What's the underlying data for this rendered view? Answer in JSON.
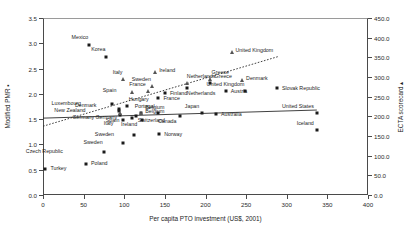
{
  "chart_data": {
    "type": "scatter",
    "title": "",
    "xlabel": "Per capita PTO investment (US$, 2001)",
    "ylabel_left": "Modified PMR ▪",
    "ylabel_right": "ECTA scorecard ▴",
    "xlim": [
      0,
      400
    ],
    "ylim_left": [
      0.0,
      3.5
    ],
    "ylim_right": [
      0.0,
      450.0
    ],
    "xticks": [
      0,
      50,
      100,
      150,
      200,
      250,
      300,
      350,
      400
    ],
    "yticks_left": [
      "0.0",
      "0.5",
      "1.0",
      "1.5",
      "2.0",
      "2.5",
      "3.0",
      "3.5"
    ],
    "yticks_right": [
      "0.0",
      "50.0",
      "100.0",
      "150.0",
      "200.0",
      "250.0",
      "300.0",
      "350.0",
      "400.0",
      "450.0"
    ],
    "grid": false,
    "legend": "none",
    "series": [
      {
        "name": "Modified PMR",
        "marker": "square",
        "axis": "left",
        "color": "#1a1a1a",
        "points": [
          {
            "label": "Mexico",
            "x": 57,
            "y": 2.97,
            "lx": -1,
            "ly": -7
          },
          {
            "label": "Korea",
            "x": 78,
            "y": 2.72,
            "lx": -1,
            "ly": -7
          },
          {
            "label": "Greece",
            "x": 205,
            "y": 2.21,
            "lx": 5,
            "ly": -6
          },
          {
            "label": "Netherlands",
            "x": 177,
            "y": 2.12,
            "lx": 0,
            "ly": 6
          },
          {
            "label": "Finland",
            "x": 150,
            "y": 2.02,
            "lx": 5,
            "ly": 1
          },
          {
            "label": "France",
            "x": 142,
            "y": 1.91,
            "lx": 5,
            "ly": 1
          },
          {
            "label": "Slovak Republic",
            "x": 288,
            "y": 2.12,
            "lx": 5,
            "ly": 1
          },
          {
            "label": "Austria",
            "x": 225,
            "y": 2.05,
            "lx": 5,
            "ly": 1
          },
          {
            "label": "United Kingdom",
            "x": 249,
            "y": 2.05,
            "lx": -1,
            "ly": -6
          },
          {
            "label": "Luxembourg",
            "x": 85,
            "y": 1.8,
            "lx": -31,
            "ly": 0
          },
          {
            "label": "Hungary",
            "x": 103,
            "y": 1.76,
            "lx": 2,
            "ly": -6
          },
          {
            "label": "Denmark",
            "x": 94,
            "y": 1.71,
            "lx": -23,
            "ly": -3
          },
          {
            "label": "New Zealand",
            "x": 93,
            "y": 1.66,
            "lx": -33,
            "ly": 0
          },
          {
            "label": "Belgium",
            "x": 121,
            "y": 1.63,
            "lx": 4,
            "ly": -5
          },
          {
            "label": "Germany",
            "x": 95,
            "y": 1.58,
            "lx": -26,
            "ly": 3
          },
          {
            "label": "Switzerland",
            "x": 114,
            "y": 1.56,
            "lx": 2,
            "ly": 5
          },
          {
            "label": "Australia",
            "x": 213,
            "y": 1.6,
            "lx": 5,
            "ly": 1
          },
          {
            "label": "Japan",
            "x": 196,
            "y": 1.63,
            "lx": -3,
            "ly": -6
          },
          {
            "label": "United States",
            "x": 337,
            "y": 1.62,
            "lx": -3,
            "ly": -6
          },
          {
            "label": "Portugal",
            "x": 141,
            "y": 1.62,
            "lx": -3,
            "ly": -6
          },
          {
            "label": "Canada",
            "x": 168,
            "y": 1.56,
            "lx": -3,
            "ly": 6
          },
          {
            "label": "Spain",
            "x": 110,
            "y": 1.52,
            "lx": -13,
            "ly": 3
          },
          {
            "label": "Ireland",
            "x": 122,
            "y": 1.49,
            "lx": -5,
            "ly": 5
          },
          {
            "label": "Italy",
            "x": 99,
            "y": 1.49,
            "lx": -10,
            "ly": 4
          },
          {
            "label": "Iceland",
            "x": 337,
            "y": 1.28,
            "lx": -3,
            "ly": -6
          },
          {
            "label": "Norway",
            "x": 143,
            "y": 1.2,
            "lx": 5,
            "ly": 1
          },
          {
            "label": "Sweden",
            "x": 112,
            "y": 1.19,
            "lx": -20,
            "ly": 0
          },
          {
            "label": "Sweden2",
            "x": 98,
            "y": 1.02,
            "lx": -20,
            "ly": 0
          },
          {
            "label": "Czech Republic",
            "x": 75,
            "y": 0.85,
            "lx": -41,
            "ly": 0
          },
          {
            "label": "Poland",
            "x": 53,
            "y": 0.62,
            "lx": 5,
            "ly": 0
          },
          {
            "label": "Turkey",
            "x": 3,
            "y": 0.52,
            "lx": 5,
            "ly": 0
          }
        ]
      },
      {
        "name": "ECTA scorecard",
        "marker": "triangle",
        "axis": "right",
        "color": "#555555",
        "points": [
          {
            "label": "Ireland",
            "x": 138,
            "y": 2.44,
            "lx": 4,
            "ly": -1
          },
          {
            "label": "Italy",
            "x": 99,
            "y": 2.3,
            "lx": -1,
            "ly": -6
          },
          {
            "label": "Sweden",
            "x": 134,
            "y": 2.15,
            "lx": -1,
            "ly": -6
          },
          {
            "label": "Netherlands",
            "x": 177,
            "y": 2.22,
            "lx": 0,
            "ly": -6
          },
          {
            "label": "Greece",
            "x": 205,
            "y": 2.3,
            "lx": 2,
            "ly": -6
          },
          {
            "label": "Denmark",
            "x": 245,
            "y": 2.28,
            "lx": 4,
            "ly": -1
          },
          {
            "label": "Spain",
            "x": 110,
            "y": 2.03,
            "lx": -16,
            "ly": -1
          },
          {
            "label": "France",
            "x": 129,
            "y": 2.06,
            "lx": -2,
            "ly": -6
          },
          {
            "label": "United Kingdom",
            "x": 232,
            "y": 2.82,
            "lx": 4,
            "ly": -1
          },
          {
            "label": "Belgium",
            "x": 121,
            "y": 1.62,
            "lx": 4,
            "ly": -1
          },
          {
            "label": "Germany",
            "x": 95,
            "y": 1.63,
            "lx": -3,
            "ly": 5
          }
        ]
      }
    ],
    "trendlines": [
      {
        "name": "ecta-trend",
        "style": "dotted",
        "x0": 0,
        "y0": 1.36,
        "x1": 290,
        "y1": 2.74
      },
      {
        "name": "pmr-trend",
        "style": "solid",
        "x0": 0,
        "y0": 1.52,
        "x1": 337,
        "y1": 1.68
      }
    ]
  }
}
